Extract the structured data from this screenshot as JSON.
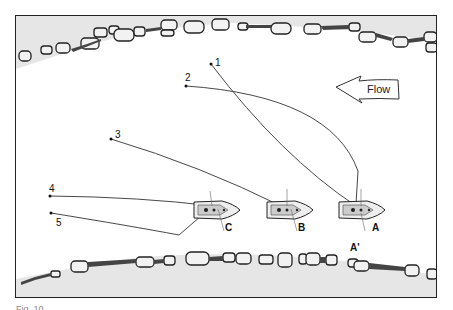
{
  "diagram": {
    "flow_label": "Flow",
    "flow_direction": "left",
    "lines": [
      {
        "label": "1",
        "start": [
          210,
          63
        ]
      },
      {
        "label": "2",
        "start": [
          185,
          85
        ]
      },
      {
        "label": "3",
        "start": [
          110,
          138
        ]
      },
      {
        "label": "4",
        "start": [
          49,
          195
        ]
      },
      {
        "label": "5",
        "start": [
          50,
          212
        ]
      }
    ],
    "boats": [
      {
        "label": "A",
        "position": [
          362,
          209
        ]
      },
      {
        "label": "B",
        "position": [
          290,
          209
        ]
      },
      {
        "label": "C",
        "position": [
          218,
          209
        ]
      }
    ],
    "point_label": "A'",
    "colors": {
      "bank_fill": "#e6e6e6",
      "rock_stroke": "#222222",
      "water": "#ffffff",
      "line": "#333333"
    }
  },
  "caption": "Fig. 10 ..."
}
